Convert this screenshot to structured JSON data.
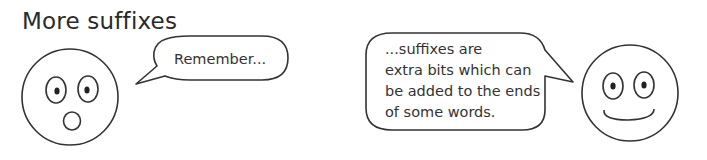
{
  "title": "More suffixes",
  "left_character": {
    "expression": "surprised",
    "speech": "Remember..."
  },
  "right_character": {
    "expression": "smiling",
    "speech_lines": [
      "...suffixes are",
      "extra bits which can",
      "be added to the ends",
      "of some words."
    ]
  },
  "colors": {
    "stroke": "#333333",
    "background": "#ffffff"
  }
}
